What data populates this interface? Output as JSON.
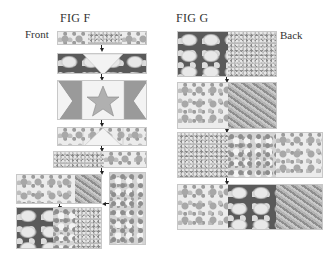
{
  "figures": {
    "fig_f": {
      "title": "FIG F",
      "side_label": "Front",
      "steps": [
        {
          "name": "top-strip",
          "pieces": [
            "floral-light",
            "ditsy",
            "floral-light"
          ]
        },
        {
          "name": "flying-geese-top",
          "pieces": [
            "floral-dark-triangle",
            "plain-triangle",
            "floral-dark-triangle"
          ]
        },
        {
          "name": "star-block",
          "pieces": [
            "half-square-triangle",
            "star-center",
            "half-square-triangle"
          ]
        },
        {
          "name": "flying-geese-bottom",
          "pieces": [
            "floral-light",
            "plain-triangle",
            "floral-light"
          ]
        },
        {
          "name": "ditsy-strip",
          "pieces": [
            "ditsy",
            "floral-light"
          ]
        },
        {
          "name": "floral-leaf-row",
          "pieces": [
            "floral-light",
            "leaf"
          ]
        },
        {
          "name": "side-panel",
          "pieces": [
            "mixed-floral"
          ]
        },
        {
          "name": "bottom-row",
          "pieces": [
            "floral-dark",
            "mixed",
            "ditsy"
          ]
        }
      ]
    },
    "fig_g": {
      "title": "FIG G",
      "side_label": "Back",
      "rows": [
        {
          "name": "row-1",
          "pieces": [
            "floral-dark",
            "ditsy"
          ]
        },
        {
          "name": "row-2",
          "pieces": [
            "floral-light",
            "leaf"
          ]
        },
        {
          "name": "row-3",
          "pieces": [
            "ditsy",
            "mixed",
            "floral-light"
          ]
        },
        {
          "name": "row-4",
          "pieces": [
            "floral-light",
            "floral-dark",
            "leaf"
          ]
        }
      ]
    }
  },
  "colors": {
    "background": "#ffffff",
    "text": "#333333",
    "arrow": "#222222",
    "block_border": "#c8c8c8"
  }
}
